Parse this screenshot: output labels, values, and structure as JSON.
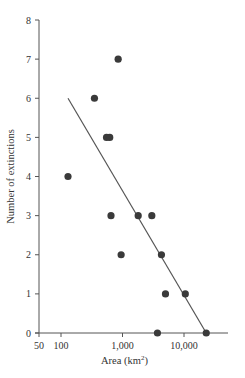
{
  "chart_data": {
    "type": "scatter",
    "title": "",
    "xlabel": "Area (km²)",
    "xlabel_base": "Area (km",
    "xlabel_sup": "2",
    "xlabel_close": ")",
    "ylabel": "Number of extinctions",
    "xscale": "log",
    "xlim": [
      50,
      40000
    ],
    "ylim": [
      0,
      8
    ],
    "grid": false,
    "legend": null,
    "x_ticks": [
      {
        "value": 50,
        "label": "50"
      },
      {
        "value": 100,
        "label": "100"
      },
      {
        "value": 1000,
        "label": "1,000"
      },
      {
        "value": 10000,
        "label": "10,000"
      }
    ],
    "y_ticks": [
      {
        "value": 0,
        "label": "0"
      },
      {
        "value": 1,
        "label": "1"
      },
      {
        "value": 2,
        "label": "2"
      },
      {
        "value": 3,
        "label": "3"
      },
      {
        "value": 4,
        "label": "4"
      },
      {
        "value": 5,
        "label": "5"
      },
      {
        "value": 6,
        "label": "6"
      },
      {
        "value": 7,
        "label": "7"
      },
      {
        "value": 8,
        "label": "8"
      }
    ],
    "points": [
      {
        "x": 130,
        "y": 4
      },
      {
        "x": 350,
        "y": 6
      },
      {
        "x": 550,
        "y": 5
      },
      {
        "x": 620,
        "y": 5
      },
      {
        "x": 850,
        "y": 7
      },
      {
        "x": 650,
        "y": 3
      },
      {
        "x": 950,
        "y": 2
      },
      {
        "x": 1800,
        "y": 3
      },
      {
        "x": 3000,
        "y": 3
      },
      {
        "x": 4300,
        "y": 2
      },
      {
        "x": 3700,
        "y": 0
      },
      {
        "x": 5000,
        "y": 1
      },
      {
        "x": 10500,
        "y": 1
      },
      {
        "x": 23000,
        "y": 0
      }
    ],
    "regression_line": {
      "x": [
        130,
        23000
      ],
      "y": [
        6,
        0
      ]
    },
    "colors": {
      "points": "#3a3a3a",
      "line": "#555555",
      "axis": "#555555"
    }
  }
}
